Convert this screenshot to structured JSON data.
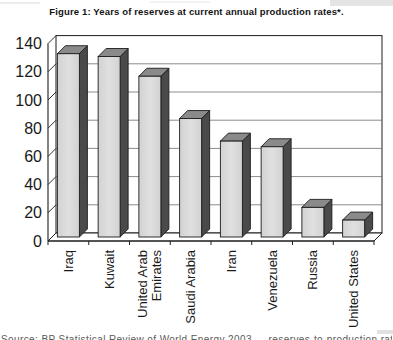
{
  "figure": {
    "title": "Figure 1: Years of reserves at current annual production rates*.",
    "footnote_partial": "Source: BP Statistical Review of World Energy 2003 — reserves-to-production ratios at year-end 2002."
  },
  "chart_data": {
    "type": "bar",
    "style": "3d-column",
    "title": "Figure 1: Years of reserves at current annual production rates*.",
    "categories": [
      "Iraq",
      "Kuwait",
      "United Arab Emirates",
      "Saudi Arabia",
      "Iran",
      "Venezuela",
      "Russia",
      "United States"
    ],
    "category_label_lines": [
      [
        "Iraq"
      ],
      [
        "Kuwait"
      ],
      [
        "United Arab",
        "Emirates"
      ],
      [
        "Saudi Arabia"
      ],
      [
        "Iran"
      ],
      [
        "Venezuela"
      ],
      [
        "Russia"
      ],
      [
        "United States"
      ]
    ],
    "values": [
      130,
      128,
      114,
      84,
      68,
      64,
      21,
      12
    ],
    "xlabel": "",
    "ylabel": "",
    "ylim": [
      0,
      140
    ],
    "yticks": [
      0,
      20,
      40,
      60,
      80,
      100,
      120,
      140
    ],
    "grid": true,
    "legend_position": "none",
    "colors": {
      "bar_front": "#d2d2d2",
      "bar_front_highlight": "#e0e0e0",
      "bar_side": "#4a4a4a",
      "bar_top": "#8a8a8a",
      "outline": "#1c1c1c",
      "gridline": "#6e6e6e",
      "axis": "#1c1c1c",
      "background": "#ffffff",
      "text": "#1a1a1a"
    }
  }
}
